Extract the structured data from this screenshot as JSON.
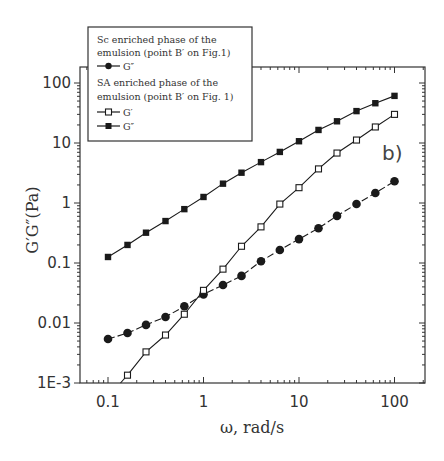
{
  "chart_data": {
    "type": "line",
    "title": "",
    "panel_label": "b)",
    "xlabel": "ω, rad/s",
    "ylabel": "G′G″(Pa)",
    "xscale": "log",
    "yscale": "log",
    "xlim": [
      0.05,
      200
    ],
    "ylim": [
      0.001,
      200
    ],
    "x_ticks": [
      0.1,
      1,
      10,
      100
    ],
    "x_tick_labels": [
      "0.1",
      "1",
      "10",
      "100"
    ],
    "y_ticks": [
      0.001,
      0.01,
      0.1,
      1,
      10,
      100
    ],
    "y_tick_labels": [
      "1E-3",
      "0.01",
      "0.1",
      "1",
      "10",
      "100"
    ],
    "grid": false,
    "legend_position": "upper-left, overlapping top frame",
    "legend": {
      "group1_title_line1": "Sc enriched phase of the",
      "group1_title_line2": "emulsion (point B′ on Fig.1)",
      "group1_entry": "G″",
      "group2_title_line1": "SA  enriched phase of the",
      "group2_title_line2": "emulsion (point B′ on Fig. 1)",
      "group2_entry1": "G′",
      "group2_entry2": "G″"
    },
    "series": [
      {
        "name": "Sc enriched phase – G″",
        "marker": "filled-circle",
        "line": "dashed",
        "x": [
          0.1,
          0.16,
          0.25,
          0.4,
          0.63,
          1.0,
          1.6,
          2.5,
          4.0,
          6.3,
          10,
          16,
          25,
          40,
          63,
          100
        ],
        "values": [
          0.0054,
          0.0068,
          0.0093,
          0.0126,
          0.019,
          0.03,
          0.043,
          0.061,
          0.107,
          0.165,
          0.25,
          0.38,
          0.61,
          0.96,
          1.47,
          2.3
        ]
      },
      {
        "name": "SA enriched phase – G′",
        "marker": "open-square",
        "line": "solid",
        "x": [
          0.16,
          0.25,
          0.4,
          0.63,
          1.0,
          1.6,
          2.5,
          4.0,
          6.3,
          10,
          16,
          25,
          40,
          63,
          100
        ],
        "values": [
          0.00135,
          0.0033,
          0.0063,
          0.014,
          0.035,
          0.079,
          0.19,
          0.4,
          0.96,
          1.8,
          3.7,
          6.8,
          11.2,
          18.5,
          30
        ]
      },
      {
        "name": "SA enriched phase – G″",
        "marker": "filled-square",
        "line": "solid",
        "x": [
          0.1,
          0.16,
          0.25,
          0.4,
          0.63,
          1.0,
          1.6,
          2.5,
          4.0,
          6.3,
          10,
          16,
          25,
          40,
          63,
          100
        ],
        "values": [
          0.126,
          0.2,
          0.32,
          0.5,
          0.79,
          1.26,
          2.1,
          3.2,
          4.8,
          7.1,
          10.7,
          16.5,
          23,
          34,
          46,
          61
        ]
      }
    ]
  },
  "colors": {
    "ink": "#1a1a1a",
    "frame": "#333333",
    "background": "#ffffff"
  }
}
